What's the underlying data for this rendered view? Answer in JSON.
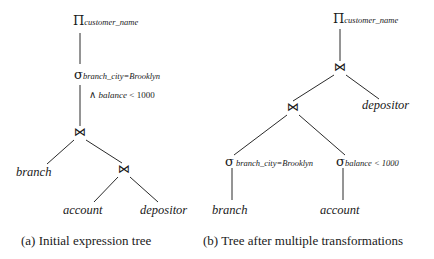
{
  "figure": {
    "background_color": "#ffffff",
    "ink_color": "#1a1a1a"
  },
  "symbols": {
    "project": "Π",
    "select": "σ",
    "join": "⋈",
    "and": "∧"
  },
  "trees": [
    {
      "id": "initial",
      "caption": "(a) Initial expression tree",
      "nodes": {
        "project": {
          "op": "Π",
          "subscript": "customer_name"
        },
        "select": {
          "op": "σ",
          "subscript_italic": "branch_city",
          "subscript_plain": "=Brooklyn",
          "condition_line2_symbol": "∧",
          "condition_line2_italic": "balance",
          "condition_line2_plain": " < 1000"
        },
        "join_upper": {
          "op": "⋈"
        },
        "join_lower": {
          "op": "⋈"
        },
        "relation_branch": "branch",
        "relation_account": "account",
        "relation_depositor": "depositor"
      }
    },
    {
      "id": "transformed",
      "caption": "(b) Tree after multiple transformations",
      "nodes": {
        "project": {
          "op": "Π",
          "subscript": "customer_name"
        },
        "join_upper": {
          "op": "⋈"
        },
        "join_lower": {
          "op": "⋈"
        },
        "select_branch_city": {
          "op": "σ",
          "subscript_italic": "branch_city",
          "subscript_plain": "=Brooklyn"
        },
        "select_balance": {
          "op": "σ",
          "subscript_italic": "balance",
          "subscript_plain": " < 1000"
        },
        "relation_depositor": "depositor",
        "relation_branch": "branch",
        "relation_account": "account"
      }
    }
  ]
}
